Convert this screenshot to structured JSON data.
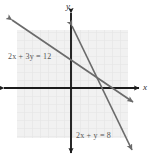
{
  "figure": {
    "background_color": "#ffffff",
    "grid": {
      "visible": true,
      "color": "#e3e3e3",
      "fill": "#f0f0f0",
      "cell_size_px": 8,
      "region_px": {
        "x": 17,
        "y": 30,
        "width": 111,
        "height": 108
      }
    },
    "axes": {
      "color": "#1c1c1c",
      "x_axis": {
        "label": "x",
        "arrow_both_ends": true,
        "y_px": 88,
        "x_start_px": 4,
        "x_end_px": 139
      },
      "y_axis": {
        "label": "y",
        "arrow_both_ends": true,
        "x_px": 71,
        "y_start_px": 12,
        "y_end_px": 154
      },
      "origin_px": {
        "x": 71,
        "y": 88
      }
    },
    "lines": [
      {
        "name": "line-2x-plus-3y-equals-12",
        "label": "2x + 3y = 12",
        "equation": "2x + 3y = 12",
        "slope": -0.6666666667,
        "y_intercept": 4,
        "x_intercept": 6,
        "color": "#6b6b6b",
        "arrow_both_ends": true,
        "endpoints_px": [
          {
            "x": 11,
            "y": 19
          },
          {
            "x": 134,
            "y": 103
          }
        ],
        "label_position_px": {
          "x": 8,
          "y": 52
        }
      },
      {
        "name": "line-2x-plus-y-equals-8",
        "label": "2x + y = 8",
        "equation": "2x + y = 8",
        "slope": -2,
        "y_intercept": 8,
        "x_intercept": 4,
        "color": "#6b6b6b",
        "arrow_both_ends": true,
        "endpoints_px": [
          {
            "x": 72,
            "y": 24
          },
          {
            "x": 134,
            "y": 152
          }
        ],
        "label_position_px": {
          "x": 76,
          "y": 131
        }
      }
    ],
    "intersection": {
      "name": "solution-point",
      "visible_marker": false,
      "point_px": {
        "x": 99,
        "y": 90
      },
      "coordinates": "(3, 2)"
    }
  },
  "labels": {
    "equation_1": "2x + 3y = 12",
    "equation_2": "2x + y = 8",
    "axis_x": "x",
    "axis_y": "y"
  }
}
